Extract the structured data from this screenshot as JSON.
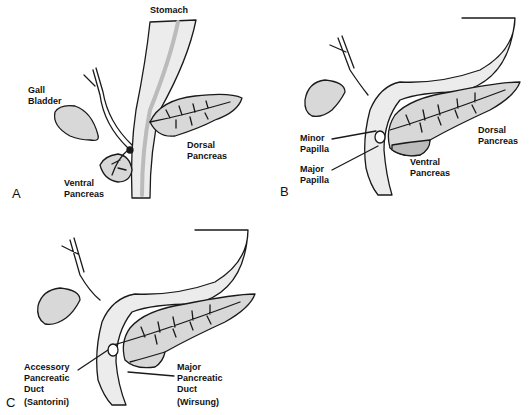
{
  "panels": [
    {
      "letter": "A",
      "labels": {
        "stomach": "Stomach",
        "gall_bladder_1": "Gall",
        "gall_bladder_2": "Bladder",
        "dorsal_1": "Dorsal",
        "dorsal_2": "Pancreas",
        "ventral_1": "Ventral",
        "ventral_2": "Pancreas"
      }
    },
    {
      "letter": "B",
      "labels": {
        "minor_1": "Minor",
        "minor_2": "Papilla",
        "major_1": "Major",
        "major_2": "Papilla",
        "dorsal_1": "Dorsal",
        "dorsal_2": "Pancreas",
        "ventral_1": "Ventral",
        "ventral_2": "Pancreas"
      }
    },
    {
      "letter": "C",
      "labels": {
        "acc_1": "Accessory",
        "acc_2": "Pancreatic",
        "acc_3": "Duct",
        "acc_4": "(Santorini)",
        "maj_1": "Major",
        "maj_2": "Pancreatic",
        "maj_3": "Duct",
        "maj_4": "(Wirsung)"
      }
    }
  ],
  "colors": {
    "line": "#1a1a1a",
    "fill": "#d8d8d8",
    "background": "#ffffff"
  }
}
